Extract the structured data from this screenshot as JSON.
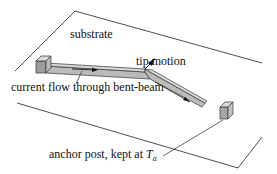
{
  "diagram": {
    "labels": {
      "substrate": "substrate",
      "tip_motion": "tip motion",
      "current_flow": "current flow through bent-beam",
      "anchor_post_prefix": "anchor post, kept at ",
      "anchor_var": "T",
      "anchor_subscript": "a"
    },
    "colors": {
      "line": "#222222",
      "beam_fill": "#b8b8b8",
      "beam_top": "#d6d6d6",
      "post_front": "#9a9a9a",
      "post_top": "#d8d8d8",
      "post_side": "#bdbdbd"
    }
  }
}
